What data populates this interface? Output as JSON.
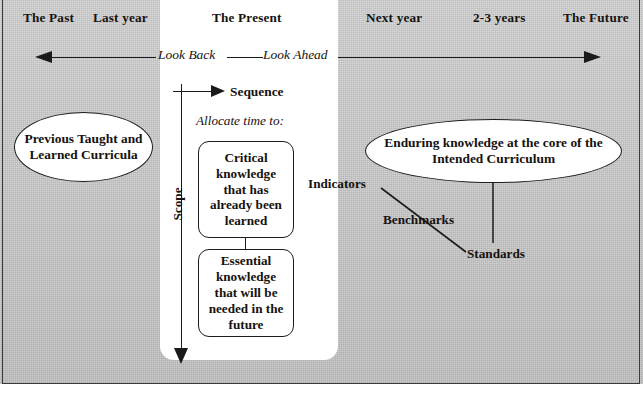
{
  "diagram": {
    "background_color": "#c9c9c9",
    "panel_color": "#ffffff",
    "ink_color": "#16120e"
  },
  "timeline": {
    "labels": [
      {
        "id": "the-past",
        "text": "The Past"
      },
      {
        "id": "last-year",
        "text": "Last year"
      },
      {
        "id": "the-present",
        "text": "The Present"
      },
      {
        "id": "next-year",
        "text": "Next year"
      },
      {
        "id": "two-three-years",
        "text": "2-3 years"
      },
      {
        "id": "the-future",
        "text": "The Future"
      }
    ],
    "axis_caption_left": "Look Back",
    "axis_caption_right": "Look Ahead"
  },
  "axes": {
    "sequence_label": "Sequence",
    "scope_label": "Scope",
    "allocate_label": "Allocate time to:"
  },
  "ovals": {
    "left": "Previous Taught and Learned Curricula",
    "right": "Enduring knowledge at the core of the Intended Curriculum"
  },
  "boxes": {
    "critical": "Critical knowledge that has already been learned",
    "essential": "Essential knowledge that will be needed in the future"
  },
  "annotations": {
    "indicators": "Indicators",
    "benchmarks": "Benchmarks",
    "standards": "Standards"
  }
}
